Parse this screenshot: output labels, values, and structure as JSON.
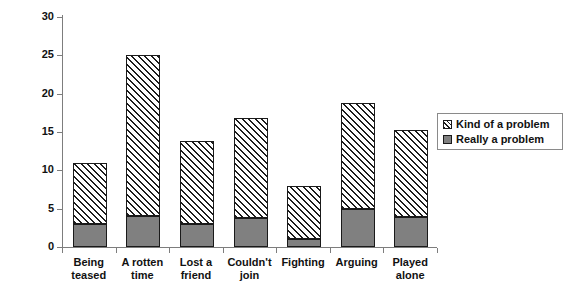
{
  "chart_data": {
    "type": "bar",
    "subtype": "stacked-bar",
    "title": "",
    "subtitle": "",
    "xlabel": "",
    "ylabel": "",
    "ylim": [
      0,
      30
    ],
    "yticks": [
      0,
      5,
      10,
      15,
      20,
      25,
      30
    ],
    "ytick_labels": [
      "0",
      "5",
      "10",
      "15",
      "20",
      "25",
      "30"
    ],
    "grid": false,
    "legend_position": "right",
    "categories": [
      "Being teased",
      "A rotten time",
      "Lost a friend",
      "Couldn't join",
      "Fighting",
      "Arguing",
      "Played alone"
    ],
    "category_lines": [
      [
        "Being",
        "teased"
      ],
      [
        "A rotten",
        "time"
      ],
      [
        "Lost a",
        "friend"
      ],
      [
        "Couldn't",
        "join"
      ],
      [
        "Fighting",
        ""
      ],
      [
        "Arguing",
        ""
      ],
      [
        "Played",
        "alone"
      ]
    ],
    "series": [
      {
        "name": "Really a problem",
        "fill": "solid",
        "color": "#808080",
        "values": [
          3,
          4,
          3,
          3.8,
          1,
          4.9,
          3.9
        ]
      },
      {
        "name": "Kind of a problem",
        "fill": "hatch",
        "color": "#ffffff",
        "values": [
          8,
          21,
          10.8,
          13,
          6.9,
          13.9,
          11.3
        ]
      }
    ],
    "totals": [
      11,
      25,
      13.8,
      16.8,
      7.9,
      18.8,
      15.2
    ]
  },
  "legend": {
    "entries": [
      {
        "label": "Kind of a problem",
        "style": "hatch"
      },
      {
        "label": "Really a problem",
        "style": "solid"
      }
    ]
  },
  "axes": {
    "y": {
      "ticks": [
        {
          "value": 30,
          "label": "30"
        },
        {
          "value": 25,
          "label": "25"
        },
        {
          "value": 20,
          "label": "20"
        },
        {
          "value": 15,
          "label": "15"
        },
        {
          "value": 10,
          "label": "10"
        },
        {
          "value": 5,
          "label": "5"
        },
        {
          "value": 0,
          "label": "0"
        }
      ]
    }
  },
  "colors": {
    "solid_fill": "#808080",
    "hatch_line": "#1d1d1d",
    "bar_border": "#1a1a1a",
    "axis": "#7d7d7d",
    "text": "#111111",
    "legend_border": "#8a8a8a",
    "background": "#ffffff"
  }
}
